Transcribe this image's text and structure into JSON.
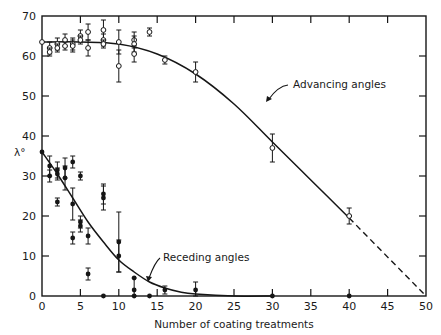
{
  "chart_data": {
    "type": "scatter",
    "title": "",
    "xlabel": "Number of coating treatments",
    "ylabel": "λ°",
    "xlim": [
      0,
      50
    ],
    "ylim": [
      0,
      70
    ],
    "x_ticks": [
      0,
      5,
      10,
      15,
      20,
      25,
      30,
      35,
      40,
      45,
      50
    ],
    "y_ticks": [
      0,
      10,
      20,
      30,
      40,
      50,
      60,
      70
    ],
    "grid": false,
    "annotations": [
      {
        "text": "Advancing angles",
        "x": 27,
        "y": 52
      },
      {
        "text": "Receding angles",
        "x": 14,
        "y": 10
      }
    ],
    "series": [
      {
        "name": "Advancing angles",
        "marker": "open",
        "points": [
          {
            "x": 0,
            "y": 63.5,
            "err": 0
          },
          {
            "x": 1,
            "y": 62,
            "err": 1.5
          },
          {
            "x": 1,
            "y": 61,
            "err": 1
          },
          {
            "x": 2,
            "y": 63,
            "err": 1.5
          },
          {
            "x": 2,
            "y": 62,
            "err": 1
          },
          {
            "x": 3,
            "y": 64,
            "err": 1.5
          },
          {
            "x": 3,
            "y": 62.5,
            "err": 1
          },
          {
            "x": 4,
            "y": 63,
            "err": 1.5
          },
          {
            "x": 4,
            "y": 62.5,
            "err": 1.5
          },
          {
            "x": 5,
            "y": 65,
            "err": 1.5
          },
          {
            "x": 5,
            "y": 64,
            "err": 1
          },
          {
            "x": 6,
            "y": 66,
            "err": 2
          },
          {
            "x": 6,
            "y": 62,
            "err": 2
          },
          {
            "x": 8,
            "y": 66.5,
            "err": 2.5
          },
          {
            "x": 8,
            "y": 64,
            "err": 1.5
          },
          {
            "x": 8,
            "y": 63,
            "err": 1
          },
          {
            "x": 10,
            "y": 63.5,
            "err": 3
          },
          {
            "x": 10,
            "y": 57.5,
            "err": 4
          },
          {
            "x": 12,
            "y": 64,
            "err": 2
          },
          {
            "x": 12,
            "y": 63,
            "err": 2
          },
          {
            "x": 12,
            "y": 60.5,
            "err": 2
          },
          {
            "x": 14,
            "y": 66,
            "err": 1
          },
          {
            "x": 16,
            "y": 59,
            "err": 1
          },
          {
            "x": 20,
            "y": 56,
            "err": 2.5
          },
          {
            "x": 30,
            "y": 37,
            "err": 3.5
          },
          {
            "x": 40,
            "y": 20,
            "err": 2
          }
        ],
        "fit_curve": [
          [
            0,
            63.5
          ],
          [
            5,
            63.5
          ],
          [
            10,
            63
          ],
          [
            15,
            60.5
          ],
          [
            20,
            55.5
          ],
          [
            25,
            48
          ],
          [
            30,
            38.5
          ],
          [
            35,
            29
          ],
          [
            40,
            19.5
          ]
        ],
        "extrapolation": [
          [
            40,
            19.5
          ],
          [
            50,
            0
          ]
        ]
      },
      {
        "name": "Receding angles",
        "marker": "filled",
        "points": [
          {
            "x": 0,
            "y": 36,
            "err": 0
          },
          {
            "x": 1,
            "y": 30,
            "err": 1.5
          },
          {
            "x": 1,
            "y": 32.5,
            "err": 2.5
          },
          {
            "x": 2,
            "y": 31.5,
            "err": 2
          },
          {
            "x": 2,
            "y": 30.5,
            "err": 1.5
          },
          {
            "x": 2,
            "y": 23.5,
            "err": 1
          },
          {
            "x": 3,
            "y": 32,
            "err": 2.5
          },
          {
            "x": 3,
            "y": 29.5,
            "err": 3
          },
          {
            "x": 4,
            "y": 33.5,
            "err": 1.5
          },
          {
            "x": 4,
            "y": 23,
            "err": 4
          },
          {
            "x": 4,
            "y": 14.5,
            "err": 1.5
          },
          {
            "x": 5,
            "y": 30,
            "err": 1
          },
          {
            "x": 5,
            "y": 18.5,
            "err": 1.5
          },
          {
            "x": 5,
            "y": 17.5,
            "err": 1.5
          },
          {
            "x": 6,
            "y": 15,
            "err": 2
          },
          {
            "x": 6,
            "y": 5.5,
            "err": 1.5
          },
          {
            "x": 8,
            "y": 25.5,
            "err": 2.5
          },
          {
            "x": 8,
            "y": 24.5,
            "err": 3
          },
          {
            "x": 8,
            "y": 0,
            "err": 0
          },
          {
            "x": 10,
            "y": 13.5,
            "err": 7.5
          },
          {
            "x": 10,
            "y": 10,
            "err": 4
          },
          {
            "x": 12,
            "y": 4.5,
            "err": 0
          },
          {
            "x": 12,
            "y": 1.5,
            "err": 3
          },
          {
            "x": 12,
            "y": 0,
            "err": 0
          },
          {
            "x": 14,
            "y": 0,
            "err": 0
          },
          {
            "x": 16,
            "y": 1.5,
            "err": 1
          },
          {
            "x": 20,
            "y": 1.5,
            "err": 2
          },
          {
            "x": 30,
            "y": 0,
            "err": 0
          },
          {
            "x": 40,
            "y": 0,
            "err": 0
          }
        ],
        "fit_curve": [
          [
            0,
            36
          ],
          [
            2,
            30.5
          ],
          [
            4,
            24.5
          ],
          [
            6,
            18.5
          ],
          [
            8,
            13.5
          ],
          [
            10,
            9
          ],
          [
            12,
            6
          ],
          [
            14,
            3.5
          ],
          [
            16,
            2
          ],
          [
            18,
            1
          ],
          [
            20,
            0.5
          ],
          [
            25,
            0
          ],
          [
            30,
            0
          ]
        ]
      }
    ]
  },
  "labels": {
    "xlabel": "Number of coating treatments",
    "ylabel": "λ°",
    "advancing": "Advancing angles",
    "receding": "Receding angles"
  }
}
